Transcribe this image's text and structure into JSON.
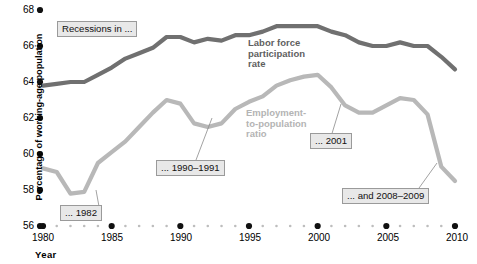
{
  "chart_data": {
    "type": "line",
    "title": "",
    "subtitle": "",
    "xlabel": "Year",
    "ylabel": "Percentage of working-age population",
    "xlim": [
      1980,
      2010
    ],
    "ylim": [
      56,
      68
    ],
    "grid": false,
    "legend_position": "inline-annotation",
    "x_ticks": [
      1980,
      1985,
      1990,
      1995,
      2000,
      2005,
      2010
    ],
    "y_ticks": [
      56,
      58,
      60,
      62,
      64,
      66,
      68
    ],
    "x": [
      1980,
      1981,
      1982,
      1983,
      1984,
      1985,
      1986,
      1987,
      1988,
      1989,
      1990,
      1991,
      1992,
      1993,
      1994,
      1995,
      1996,
      1997,
      1998,
      1999,
      2000,
      2001,
      2002,
      2003,
      2004,
      2005,
      2006,
      2007,
      2008,
      2009,
      2010
    ],
    "series": [
      {
        "name": "Labor force participation rate",
        "color": "#707070",
        "values": [
          63.8,
          63.9,
          64.0,
          64.0,
          64.4,
          64.8,
          65.3,
          65.6,
          65.9,
          66.5,
          66.5,
          66.2,
          66.4,
          66.3,
          66.6,
          66.6,
          66.8,
          67.1,
          67.1,
          67.1,
          67.1,
          66.8,
          66.6,
          66.2,
          66.0,
          66.0,
          66.2,
          66.0,
          66.0,
          65.4,
          64.7
        ]
      },
      {
        "name": "Employment-to-population ratio",
        "color": "#b8b8b8",
        "values": [
          59.2,
          59.0,
          57.8,
          57.9,
          59.5,
          60.1,
          60.7,
          61.5,
          62.3,
          63.0,
          62.8,
          61.7,
          61.5,
          61.7,
          62.5,
          62.9,
          63.2,
          63.8,
          64.1,
          64.3,
          64.4,
          63.7,
          62.7,
          62.3,
          62.3,
          62.7,
          63.1,
          63.0,
          62.2,
          59.3,
          58.5
        ]
      }
    ],
    "annotations": [
      {
        "id": "recessions-in",
        "text": "Recessions in ..."
      },
      {
        "id": "recession-1982",
        "text": "... 1982"
      },
      {
        "id": "recession-1990-1991",
        "text": "... 1990–1991"
      },
      {
        "id": "recession-2001",
        "text": "... 2001"
      },
      {
        "id": "recession-2008-2009",
        "text": "... and 2008–2009"
      }
    ],
    "series_labels": [
      {
        "id": "lfpr-label",
        "text": "Labor force\nparticipation\nrate"
      },
      {
        "id": "epop-label",
        "text": "Employment-\nto-population\nratio"
      }
    ]
  },
  "axes": {
    "y_title": "Percentage of working-age population",
    "x_title": "Year",
    "y_tick_labels": [
      "68",
      "66",
      "64",
      "62",
      "60",
      "58",
      "56"
    ],
    "x_tick_labels": [
      "1980",
      "1985",
      "1990",
      "1995",
      "2000",
      "2005",
      "2010"
    ]
  },
  "colors": {
    "lfpr_line": "#707070",
    "epop_line": "#b8b8b8",
    "tick_dot": "#111111",
    "minor_dot": "#bdbdbd",
    "callout_bg": "#e8e8e8",
    "callout_border": "#9a9a9a"
  }
}
